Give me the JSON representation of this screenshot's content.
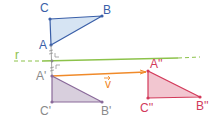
{
  "colors": {
    "abc": "#3a5fa8",
    "abc_fill": "#d6e4f3",
    "prime": "#8a6a9a",
    "prime_fill": "#d8cfdd",
    "double": "#d23a5a",
    "double_fill": "#f2c6d0",
    "line_r": "#8cc24a",
    "vector": "#f08a2a"
  },
  "labels": {
    "A": "A",
    "B": "B",
    "C": "C",
    "A1": "A'",
    "B1": "B'",
    "C1": "C'",
    "A2": "A''",
    "B2": "B''",
    "C2": "C''",
    "r": "r",
    "v": "v"
  }
}
